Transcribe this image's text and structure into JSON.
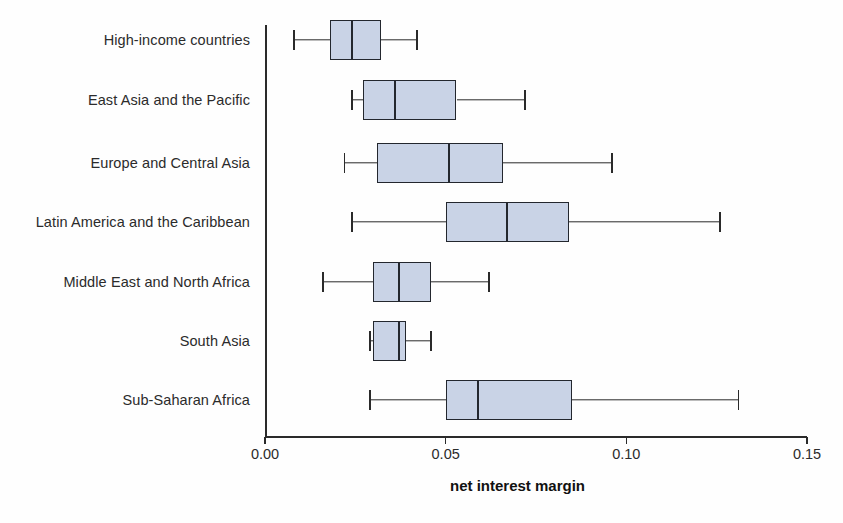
{
  "chart_data": {
    "type": "box",
    "title": "",
    "xlabel": "net interest margin",
    "ylabel": "",
    "xlim": [
      0.0,
      0.15
    ],
    "xticks": [
      0.0,
      0.05,
      0.1,
      0.15
    ],
    "xtick_labels": [
      "0.00",
      "0.05",
      "0.10",
      "0.15"
    ],
    "grid": false,
    "legend": "none",
    "orientation": "horizontal",
    "categories": [
      "High-income countries",
      "East Asia and the Pacific",
      "Europe and Central Asia",
      "Latin America and the Caribbean",
      "Middle East and North Africa",
      "South Asia",
      "Sub-Saharan Africa"
    ],
    "boxes": [
      {
        "category": "High-income countries",
        "whisker_low": 0.008,
        "q1": 0.018,
        "median": 0.024,
        "q3": 0.032,
        "whisker_high": 0.042
      },
      {
        "category": "East Asia and the Pacific",
        "whisker_low": 0.024,
        "q1": 0.027,
        "median": 0.036,
        "q3": 0.053,
        "whisker_high": 0.072
      },
      {
        "category": "Europe and Central Asia",
        "whisker_low": 0.022,
        "q1": 0.031,
        "median": 0.051,
        "q3": 0.066,
        "whisker_high": 0.096
      },
      {
        "category": "Latin America and the Caribbean",
        "whisker_low": 0.024,
        "q1": 0.05,
        "median": 0.067,
        "q3": 0.084,
        "whisker_high": 0.126
      },
      {
        "category": "Middle East and North Africa",
        "whisker_low": 0.016,
        "q1": 0.03,
        "median": 0.037,
        "q3": 0.046,
        "whisker_high": 0.062
      },
      {
        "category": "South Asia",
        "whisker_low": 0.029,
        "q1": 0.03,
        "median": 0.037,
        "q3": 0.039,
        "whisker_high": 0.046
      },
      {
        "category": "Sub-Saharan Africa",
        "whisker_low": 0.029,
        "q1": 0.05,
        "median": 0.059,
        "q3": 0.085,
        "whisker_high": 0.131
      }
    ],
    "colors": {
      "box_fill": "#c9d3e6",
      "box_stroke": "#23272e",
      "whisker": "#2a2a2a",
      "axis": "#2a2a2a",
      "text": "#2b2b2b",
      "background": "#fefefe"
    }
  },
  "geometry": {
    "plot_left_px": 265,
    "plot_right_px": 807,
    "x_min": 0.0,
    "x_max": 0.15,
    "row_centers_px": [
      40,
      100,
      163,
      222,
      282,
      341,
      400
    ]
  }
}
